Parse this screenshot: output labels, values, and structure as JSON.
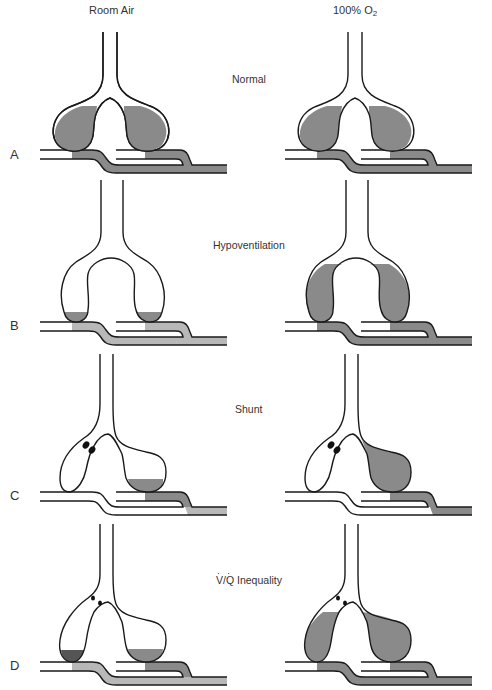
{
  "columns": {
    "left": {
      "label": "Room Air"
    },
    "right": {
      "label_prefix": "100% O",
      "label_sub": "2"
    }
  },
  "colors": {
    "stroke": "#1a1a1a",
    "medium": "#8a8a8a",
    "light": "#b8b8b8",
    "dark": "#5a5a5a",
    "white": "#ffffff",
    "obstruction": "#111111"
  },
  "rows": [
    {
      "letter": "A",
      "title": "Normal"
    },
    {
      "letter": "B",
      "title": "Hypoventilation"
    },
    {
      "letter": "C",
      "title": "Shunt"
    },
    {
      "letter": "D",
      "title_v": "V",
      "title_rest": "/",
      "title_q": "Q",
      "title_tail": " Inequality",
      "title": "V/Q Inequality"
    }
  ],
  "panels": [
    {
      "row": "A",
      "column": "Room Air",
      "alveolus_left_fill": "medium",
      "alveolus_right_fill": "medium",
      "cap_left": "medium",
      "cap_right": "medium",
      "vein": "medium"
    },
    {
      "row": "A",
      "column": "100% O2",
      "alveolus_left_fill": "medium",
      "alveolus_right_fill": "medium",
      "cap_left": "medium",
      "cap_right": "medium",
      "vein": "medium"
    },
    {
      "row": "B",
      "column": "Room Air",
      "alveolus_left_fill": "medium (low level)",
      "alveolus_right_fill": "medium (low level)",
      "cap_left": "light",
      "cap_right": "light",
      "vein": "light"
    },
    {
      "row": "B",
      "column": "100% O2",
      "alveolus_left_fill": "medium",
      "alveolus_right_fill": "medium",
      "cap_left": "medium",
      "cap_right": "medium",
      "vein": "medium"
    },
    {
      "row": "C",
      "column": "Room Air",
      "alveolus_left_fill": "none (obstructed)",
      "alveolus_right_fill": "medium (low level)",
      "cap_left": "white",
      "cap_right": "medium",
      "vein": "light"
    },
    {
      "row": "C",
      "column": "100% O2",
      "alveolus_left_fill": "none (obstructed)",
      "alveolus_right_fill": "medium",
      "cap_left": "white",
      "cap_right": "medium",
      "vein": "light"
    },
    {
      "row": "D",
      "column": "Room Air",
      "alveolus_left_fill": "dark (low level)",
      "alveolus_right_fill": "medium (low level)",
      "cap_left": "light",
      "cap_right": "medium",
      "vein": "light"
    },
    {
      "row": "D",
      "column": "100% O2",
      "alveolus_left_fill": "medium",
      "alveolus_right_fill": "medium",
      "cap_left": "medium",
      "cap_right": "medium",
      "vein": "medium"
    }
  ]
}
